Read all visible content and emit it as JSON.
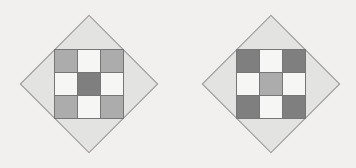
{
  "figure": {
    "colors": {
      "background": "#f1f0ee",
      "diamond_fill": "#e3e3e2",
      "diamond_border": "#919191",
      "grid_line": "#767676",
      "cell_light": "#f6f6f4",
      "cell_medium": "#acacac",
      "cell_dark": "#7f7f7f"
    },
    "diamonds": [
      {
        "name": "left-diamond",
        "grid": [
          [
            "medium",
            "light",
            "medium"
          ],
          [
            "light",
            "dark",
            "light"
          ],
          [
            "medium",
            "light",
            "medium"
          ]
        ]
      },
      {
        "name": "right-diamond",
        "grid": [
          [
            "dark",
            "light",
            "dark"
          ],
          [
            "light",
            "medium",
            "light"
          ],
          [
            "dark",
            "light",
            "dark"
          ]
        ]
      }
    ]
  }
}
